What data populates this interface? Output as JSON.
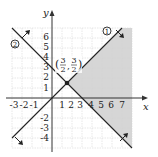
{
  "figure": {
    "type": "graph-of-linear-inequalities",
    "axes": {
      "x_label": "x",
      "y_label": "y",
      "x_ticks": [
        "-3",
        "-2",
        "-1",
        "1",
        "2",
        "3",
        "4",
        "5",
        "6",
        "7"
      ],
      "y_ticks_positive": [
        "1",
        "2",
        "3",
        "4",
        "5",
        "6"
      ],
      "y_ticks_negative": [
        "-2",
        "-3",
        "-4"
      ],
      "x_range": [
        -4,
        8
      ],
      "y_range": [
        -5,
        7
      ]
    },
    "lines": [
      {
        "id": "1",
        "label": "1",
        "equation": "y = x",
        "shade_side": "below-right"
      },
      {
        "id": "2",
        "label": "2",
        "equation": "y = 3 - x",
        "shade_side": "above-right"
      }
    ],
    "intersection": {
      "label_open": "(",
      "x_num": "3",
      "x_den": "2",
      "comma": ",",
      "y_num": "3",
      "y_den": "2",
      "label_close": ")",
      "x": 1.5,
      "y": 1.5
    },
    "colors": {
      "shade": "#d4d4d4",
      "grid": "#d0d0d0",
      "line": "#222222",
      "axis": "#333333"
    }
  }
}
